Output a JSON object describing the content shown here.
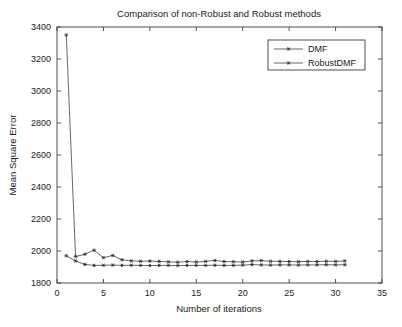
{
  "chart_data": {
    "type": "line",
    "title": "Comparison of non-Robust and Robust methods",
    "xlabel": "Number of iterations",
    "ylabel": "Mean Square Error",
    "xlim": [
      0,
      35
    ],
    "ylim": [
      1800,
      3400
    ],
    "xticks": [
      0,
      5,
      10,
      15,
      20,
      25,
      30,
      35
    ],
    "yticks": [
      1800,
      2000,
      2200,
      2400,
      2600,
      2800,
      3000,
      3200,
      3400
    ],
    "xtick_labels": [
      "0",
      "5",
      "10",
      "15",
      "20",
      "25",
      "30",
      "35"
    ],
    "ytick_labels": [
      "1800",
      "2000",
      "2200",
      "2400",
      "2600",
      "2800",
      "3000",
      "3200",
      "3400"
    ],
    "grid": false,
    "legend_position": "upper right",
    "marker": "star",
    "x": [
      1,
      2,
      3,
      4,
      5,
      6,
      7,
      8,
      9,
      10,
      11,
      12,
      13,
      14,
      15,
      16,
      17,
      18,
      19,
      20,
      21,
      22,
      23,
      24,
      25,
      26,
      27,
      28,
      29,
      30,
      31
    ],
    "series": [
      {
        "name": "DMF",
        "color": "#4a4a4a",
        "values": [
          3350,
          1965,
          1980,
          2005,
          1958,
          1972,
          1945,
          1938,
          1936,
          1937,
          1935,
          1932,
          1930,
          1934,
          1931,
          1935,
          1941,
          1934,
          1933,
          1931,
          1938,
          1940,
          1936,
          1935,
          1934,
          1933,
          1935,
          1934,
          1936,
          1935,
          1938
        ]
      },
      {
        "name": "RobustDMF",
        "color": "#4a4a4a",
        "values": [
          1970,
          1938,
          1916,
          1910,
          1911,
          1912,
          1910,
          1911,
          1910,
          1909,
          1910,
          1910,
          1909,
          1910,
          1910,
          1910,
          1911,
          1910,
          1910,
          1912,
          1915,
          1913,
          1912,
          1913,
          1913,
          1912,
          1913,
          1913,
          1914,
          1913,
          1914
        ]
      }
    ]
  },
  "legend": {
    "entries": [
      {
        "label": "DMF"
      },
      {
        "label": "RobustDMF"
      }
    ]
  }
}
